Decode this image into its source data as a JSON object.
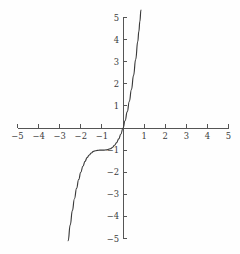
{
  "chart_data": {
    "type": "line",
    "title": "",
    "subtitle": "",
    "xlabel": "",
    "ylabel": "",
    "xlim": [
      -5,
      5
    ],
    "ylim": [
      -5,
      5
    ],
    "grid": false,
    "legend": null,
    "axis_style": "centered-cross",
    "x_ticks": [
      -5,
      -4,
      -3,
      -2,
      -1,
      1,
      2,
      3,
      4,
      5
    ],
    "y_ticks": [
      -5,
      -4,
      -3,
      -2,
      -1,
      1,
      2,
      3,
      4,
      5
    ],
    "x_tick_labels": [
      "−5",
      "−4",
      "−3",
      "−2",
      "−1",
      "1",
      "2",
      "3",
      "4",
      "5"
    ],
    "y_tick_labels": [
      "−5",
      "−4",
      "−3",
      "−2",
      "−1",
      "1",
      "2",
      "3",
      "4",
      "5"
    ],
    "series": [
      {
        "name": "curve",
        "color": "#3a3a3a",
        "x": [
          -2.71,
          -2.6,
          -2.5,
          -2.4,
          -2.3,
          -2.2,
          -2.1,
          -2.0,
          -1.9,
          -1.8,
          -1.7,
          -1.6,
          -1.5,
          -1.4,
          -1.3,
          -1.2,
          -1.1,
          -1.0,
          -0.9,
          -0.8,
          -0.7,
          -0.6,
          -0.5,
          -0.4,
          -0.3,
          -0.2,
          -0.1,
          0.0,
          0.1,
          0.2,
          0.3,
          0.4,
          0.5,
          0.6,
          0.7,
          0.75,
          0.8,
          0.85
        ],
        "y": [
          -6.0,
          -5.1,
          -4.38,
          -3.74,
          -3.2,
          -2.73,
          -2.33,
          -2.0,
          -1.73,
          -1.51,
          -1.34,
          -1.22,
          -1.13,
          -1.06,
          -1.03,
          -1.01,
          -1.0,
          -1.0,
          -1.0,
          -0.99,
          -0.97,
          -0.94,
          -0.88,
          -0.78,
          -0.66,
          -0.49,
          -0.27,
          0.0,
          0.33,
          0.73,
          1.2,
          1.74,
          2.38,
          3.1,
          3.91,
          4.36,
          4.83,
          5.34
        ]
      }
    ],
    "annotations": []
  },
  "plot": {
    "origin_px": {
      "x": 123,
      "y": 128
    },
    "unit_px": {
      "x": 21.1,
      "y": 22.1
    },
    "colors": {
      "background": "#fefefe",
      "axis": "#555555",
      "curve": "#3a3a3a",
      "label": "#3c3c3c"
    }
  }
}
